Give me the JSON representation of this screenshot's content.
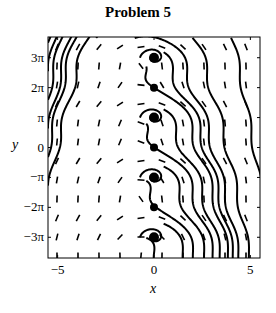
{
  "title": "Problem 5",
  "xlabel": "x",
  "ylabel": "y",
  "xticks": [
    {
      "label": "−5",
      "value": -5
    },
    {
      "label": "0",
      "value": 0
    },
    {
      "label": "5",
      "value": 5
    }
  ],
  "yticks": [
    {
      "label": "3π",
      "value": 9.4248
    },
    {
      "label": "2π",
      "value": 6.2832
    },
    {
      "label": "π",
      "value": 3.1416
    },
    {
      "label": "0",
      "value": 0
    },
    {
      "label": "−π",
      "value": -3.1416
    },
    {
      "label": "−2π",
      "value": -6.2832
    },
    {
      "label": "−3π",
      "value": -9.4248
    }
  ],
  "chart_data": {
    "type": "scatter",
    "subtype": "phase-portrait",
    "title": "Problem 5",
    "xlabel": "x",
    "ylabel": "y",
    "xlim": [
      -5.5,
      5.5
    ],
    "ylim": [
      -11.6,
      11.6
    ],
    "grid": false,
    "legend": null,
    "equilibria": [
      {
        "x": 0,
        "y": 9.4248,
        "kind": "spiral"
      },
      {
        "x": 0,
        "y": 6.2832,
        "kind": "saddle"
      },
      {
        "x": 0,
        "y": 3.1416,
        "kind": "spiral"
      },
      {
        "x": 0,
        "y": 0,
        "kind": "saddle"
      },
      {
        "x": 0,
        "y": -3.1416,
        "kind": "spiral"
      },
      {
        "x": 0,
        "y": -6.2832,
        "kind": "saddle"
      },
      {
        "x": 0,
        "y": -9.4248,
        "kind": "spiral"
      }
    ],
    "direction_field": "short line segments on regular grid, mostly oriented down-right",
    "trajectories": "diagonal curves from upper-left to lower-right, spiraling into equilibria on x=0"
  }
}
